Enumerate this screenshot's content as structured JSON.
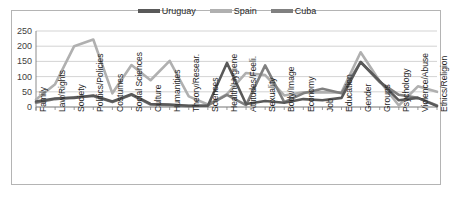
{
  "chart_data": {
    "type": "line",
    "title": "",
    "xlabel": "",
    "ylabel": "",
    "ylim": [
      0,
      250
    ],
    "yticks": [
      0,
      50,
      100,
      150,
      200,
      250
    ],
    "grid": true,
    "legend_position": "top-center",
    "categories": [
      "Family",
      "Law/Rights",
      "Society",
      "Politics/Policies",
      "Costumes",
      "Social Sciences",
      "Culture",
      "Humanities",
      "Theory/Resear.",
      "Sciences",
      "Health/Hygiene",
      "Attitudes/Feeli.",
      "Sexuality",
      "Body/Image",
      "Economy",
      "Job",
      "Education",
      "Gender",
      "Groups",
      "Psychology",
      "Violence/Abuse",
      "Ethics/Religion"
    ],
    "series": [
      {
        "name": "Uruguay",
        "color": "#595959",
        "values": [
          18,
          28,
          30,
          38,
          18,
          42,
          10,
          8,
          4,
          4,
          145,
          10,
          20,
          14,
          26,
          22,
          30,
          148,
          85,
          22,
          30,
          3
        ]
      },
      {
        "name": "Spain",
        "color": "#b0b0b0",
        "values": [
          25,
          75,
          200,
          222,
          45,
          138,
          88,
          152,
          35,
          8,
          42,
          112,
          105,
          38,
          48,
          48,
          48,
          180,
          85,
          5,
          68,
          50
        ]
      },
      {
        "name": "Cuba",
        "color": "#808080",
        "values": [
          14,
          26,
          32,
          36,
          16,
          40,
          8,
          6,
          3,
          5,
          40,
          6,
          137,
          16,
          45,
          60,
          45,
          148,
          82,
          40,
          30,
          5
        ]
      }
    ]
  },
  "legend": {
    "items": [
      {
        "label": "Uruguay",
        "color": "#595959"
      },
      {
        "label": "Spain",
        "color": "#b0b0b0"
      },
      {
        "label": "Cuba",
        "color": "#808080"
      }
    ]
  }
}
